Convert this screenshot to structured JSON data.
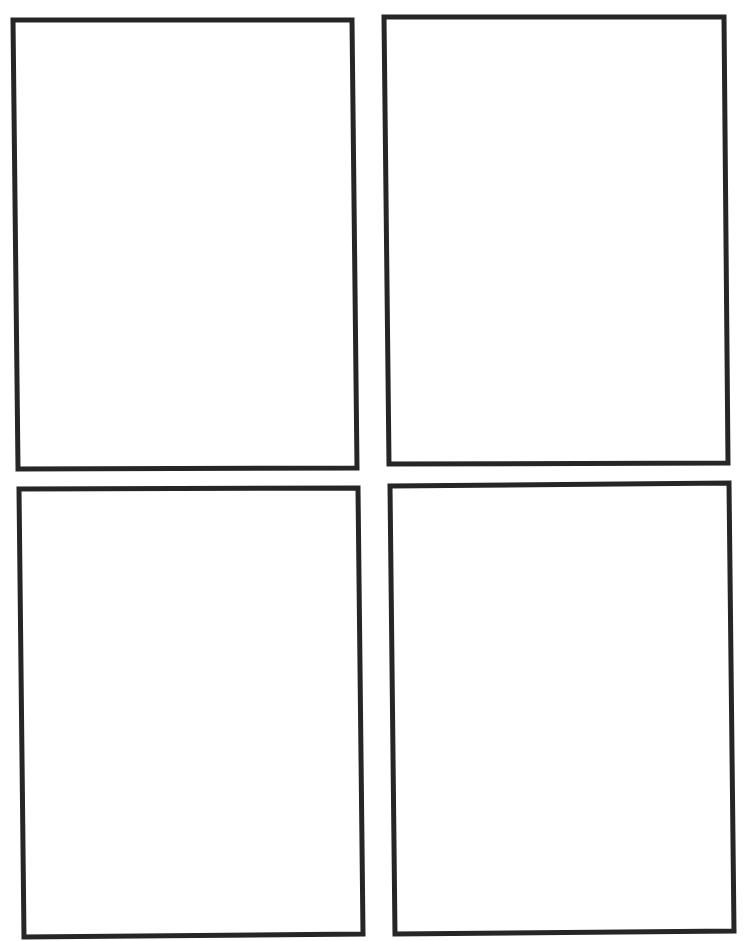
{
  "page": {
    "background": "#ffffff",
    "border_color": "#262626"
  },
  "panels": [
    {
      "id": "panel-1",
      "position": "top-left",
      "content": "",
      "points": "13,20 352,20 357,468 18,469"
    },
    {
      "id": "panel-2",
      "position": "top-right",
      "content": "",
      "points": "384,17 724,17 728,463 389,464"
    },
    {
      "id": "panel-3",
      "position": "bottom-left",
      "content": "",
      "points": "19,489 358,488 363,934 24,937"
    },
    {
      "id": "panel-4",
      "position": "bottom-right",
      "content": "",
      "points": "390,486 729,483 734,931 395,934"
    }
  ]
}
